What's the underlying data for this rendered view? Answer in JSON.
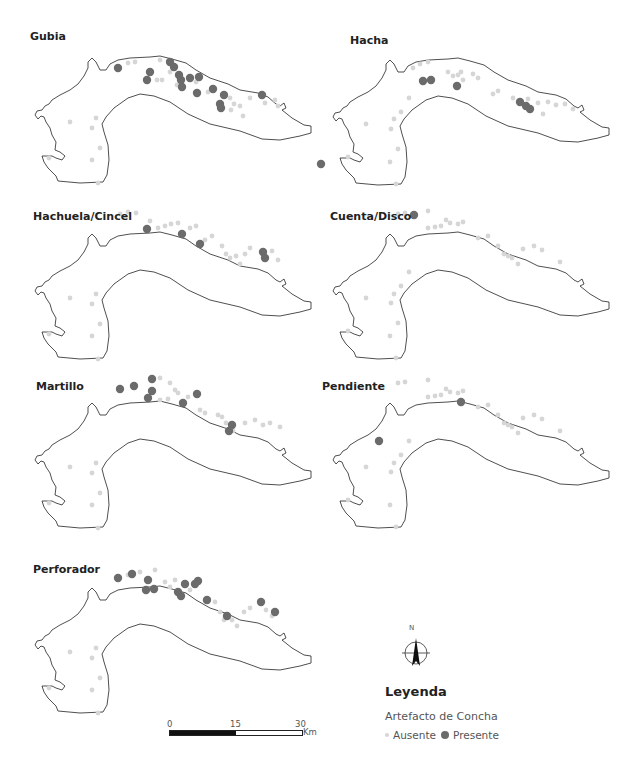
{
  "panels": [
    {
      "id": "gubia",
      "title": "Gubia",
      "title_pos": [
        30,
        30
      ],
      "offset": [
        0,
        0
      ],
      "present": [
        [
          118,
          68
        ],
        [
          150,
          72
        ],
        [
          147,
          80
        ],
        [
          170,
          62
        ],
        [
          174,
          67
        ],
        [
          179,
          75
        ],
        [
          181,
          80
        ],
        [
          190,
          78
        ],
        [
          199,
          77
        ],
        [
          182,
          87
        ],
        [
          197,
          93
        ],
        [
          213,
          89
        ],
        [
          224,
          95
        ],
        [
          220,
          104
        ],
        [
          221,
          108
        ],
        [
          262,
          95
        ]
      ],
      "absent": [
        [
          128,
          63
        ],
        [
          135,
          62
        ],
        [
          160,
          60
        ],
        [
          170,
          72
        ],
        [
          177,
          85
        ],
        [
          157,
          80
        ],
        [
          162,
          80
        ],
        [
          196,
          82
        ],
        [
          208,
          92
        ],
        [
          230,
          98
        ],
        [
          231,
          110
        ],
        [
          234,
          104
        ],
        [
          240,
          106
        ],
        [
          243,
          116
        ],
        [
          250,
          98
        ],
        [
          265,
          103
        ],
        [
          275,
          100
        ],
        [
          278,
          106
        ],
        [
          96,
          118
        ],
        [
          92,
          128
        ],
        [
          100,
          148
        ],
        [
          92,
          160
        ],
        [
          98,
          183
        ],
        [
          70,
          122
        ],
        [
          49,
          158
        ]
      ]
    },
    {
      "id": "hacha",
      "title": "Hacha",
      "title_pos": [
        350,
        34
      ],
      "offset": [
        298,
        2
      ],
      "present": [
        [
          125,
          79
        ],
        [
          133,
          78
        ],
        [
          159,
          84
        ],
        [
          222,
          100
        ],
        [
          228,
          104
        ],
        [
          232,
          107
        ],
        [
          23,
          162
        ]
      ],
      "absent": [
        [
          115,
          66
        ],
        [
          122,
          62
        ],
        [
          130,
          60
        ],
        [
          150,
          70
        ],
        [
          155,
          74
        ],
        [
          160,
          73
        ],
        [
          163,
          70
        ],
        [
          165,
          78
        ],
        [
          175,
          72
        ],
        [
          180,
          76
        ],
        [
          195,
          92
        ],
        [
          200,
          89
        ],
        [
          215,
          96
        ],
        [
          230,
          97
        ],
        [
          240,
          101
        ],
        [
          245,
          112
        ],
        [
          250,
          100
        ],
        [
          258,
          103
        ],
        [
          267,
          102
        ],
        [
          275,
          107
        ],
        [
          96,
          117
        ],
        [
          93,
          127
        ],
        [
          103,
          110
        ],
        [
          111,
          96
        ],
        [
          100,
          147
        ],
        [
          92,
          160
        ],
        [
          98,
          182
        ],
        [
          68,
          122
        ],
        [
          50,
          155
        ]
      ]
    },
    {
      "id": "hachuela",
      "title": "Hachuela/Cincel",
      "title_pos": [
        33,
        210
      ],
      "offset": [
        0,
        176
      ],
      "present": [
        [
          147,
          53
        ],
        [
          182,
          58
        ],
        [
          200,
          68
        ],
        [
          263,
          76
        ],
        [
          265,
          82
        ]
      ],
      "absent": [
        [
          120,
          38
        ],
        [
          128,
          36
        ],
        [
          136,
          37
        ],
        [
          150,
          45
        ],
        [
          158,
          52
        ],
        [
          165,
          50
        ],
        [
          171,
          48
        ],
        [
          178,
          47
        ],
        [
          190,
          52
        ],
        [
          196,
          50
        ],
        [
          205,
          64
        ],
        [
          212,
          60
        ],
        [
          222,
          70
        ],
        [
          226,
          78
        ],
        [
          230,
          82
        ],
        [
          236,
          80
        ],
        [
          240,
          88
        ],
        [
          245,
          78
        ],
        [
          250,
          72
        ],
        [
          272,
          75
        ],
        [
          278,
          84
        ],
        [
          96,
          118
        ],
        [
          92,
          128
        ],
        [
          100,
          148
        ],
        [
          92,
          160
        ],
        [
          98,
          183
        ],
        [
          70,
          122
        ],
        [
          49,
          158
        ]
      ]
    },
    {
      "id": "cuenta",
      "title": "Cuenta/Disco",
      "title_pos": [
        330,
        210
      ],
      "offset": [
        298,
        176
      ],
      "present": [
        [
          116,
          39
        ]
      ],
      "absent": [
        [
          100,
          38
        ],
        [
          107,
          37
        ],
        [
          130,
          35
        ],
        [
          148,
          44
        ],
        [
          152,
          47
        ],
        [
          160,
          48
        ],
        [
          165,
          46
        ],
        [
          130,
          52
        ],
        [
          137,
          51
        ],
        [
          143,
          50
        ],
        [
          180,
          62
        ],
        [
          190,
          60
        ],
        [
          200,
          70
        ],
        [
          206,
          78
        ],
        [
          210,
          80
        ],
        [
          214,
          82
        ],
        [
          220,
          88
        ],
        [
          225,
          73
        ],
        [
          236,
          70
        ],
        [
          244,
          74
        ],
        [
          262,
          86
        ],
        [
          96,
          118
        ],
        [
          93,
          127
        ],
        [
          103,
          110
        ],
        [
          111,
          96
        ],
        [
          100,
          147
        ],
        [
          92,
          160
        ],
        [
          98,
          182
        ],
        [
          68,
          122
        ],
        [
          50,
          155
        ]
      ]
    },
    {
      "id": "martillo",
      "title": "Martillo",
      "title_pos": [
        36,
        380
      ],
      "offset": [
        0,
        345
      ],
      "present": [
        [
          120,
          44
        ],
        [
          134,
          41
        ],
        [
          152,
          34
        ],
        [
          152,
          46
        ],
        [
          148,
          53
        ],
        [
          183,
          58
        ],
        [
          197,
          49
        ],
        [
          232,
          80
        ],
        [
          229,
          86
        ]
      ],
      "absent": [
        [
          160,
          33
        ],
        [
          170,
          38
        ],
        [
          175,
          45
        ],
        [
          160,
          55
        ],
        [
          168,
          54
        ],
        [
          178,
          48
        ],
        [
          188,
          52
        ],
        [
          200,
          65
        ],
        [
          205,
          68
        ],
        [
          218,
          70
        ],
        [
          222,
          72
        ],
        [
          226,
          78
        ],
        [
          233,
          86
        ],
        [
          245,
          78
        ],
        [
          255,
          75
        ],
        [
          263,
          80
        ],
        [
          270,
          78
        ],
        [
          280,
          82
        ],
        [
          96,
          118
        ],
        [
          92,
          128
        ],
        [
          100,
          148
        ],
        [
          92,
          160
        ],
        [
          98,
          183
        ],
        [
          70,
          122
        ],
        [
          49,
          158
        ]
      ]
    },
    {
      "id": "pendiente",
      "title": "Pendiente",
      "title_pos": [
        322,
        380
      ],
      "offset": [
        298,
        345
      ],
      "present": [
        [
          163,
          57
        ],
        [
          81,
          96
        ]
      ],
      "absent": [
        [
          100,
          38
        ],
        [
          107,
          37
        ],
        [
          130,
          35
        ],
        [
          148,
          44
        ],
        [
          152,
          47
        ],
        [
          160,
          48
        ],
        [
          165,
          46
        ],
        [
          130,
          52
        ],
        [
          137,
          51
        ],
        [
          143,
          50
        ],
        [
          180,
          62
        ],
        [
          190,
          60
        ],
        [
          200,
          70
        ],
        [
          206,
          78
        ],
        [
          210,
          80
        ],
        [
          214,
          82
        ],
        [
          220,
          88
        ],
        [
          225,
          73
        ],
        [
          236,
          70
        ],
        [
          244,
          74
        ],
        [
          262,
          86
        ],
        [
          96,
          118
        ],
        [
          93,
          127
        ],
        [
          103,
          110
        ],
        [
          111,
          96
        ],
        [
          92,
          160
        ],
        [
          98,
          182
        ],
        [
          68,
          122
        ],
        [
          50,
          155
        ]
      ]
    },
    {
      "id": "perforador",
      "title": "Perforador",
      "title_pos": [
        33,
        563
      ],
      "offset": [
        0,
        530
      ],
      "present": [
        [
          118,
          48
        ],
        [
          132,
          44
        ],
        [
          148,
          50
        ],
        [
          146,
          60
        ],
        [
          154,
          59
        ],
        [
          178,
          62
        ],
        [
          181,
          66
        ],
        [
          185,
          54
        ],
        [
          195,
          54
        ],
        [
          198,
          51
        ],
        [
          207,
          70
        ],
        [
          227,
          86
        ],
        [
          261,
          72
        ],
        [
          275,
          82
        ]
      ],
      "absent": [
        [
          128,
          45
        ],
        [
          140,
          42
        ],
        [
          155,
          40
        ],
        [
          165,
          52
        ],
        [
          170,
          57
        ],
        [
          175,
          50
        ],
        [
          190,
          60
        ],
        [
          205,
          71
        ],
        [
          215,
          72
        ],
        [
          220,
          82
        ],
        [
          224,
          90
        ],
        [
          232,
          90
        ],
        [
          237,
          96
        ],
        [
          244,
          82
        ],
        [
          250,
          78
        ],
        [
          266,
          80
        ],
        [
          272,
          86
        ],
        [
          96,
          118
        ],
        [
          92,
          128
        ],
        [
          100,
          148
        ],
        [
          92,
          160
        ],
        [
          98,
          183
        ],
        [
          70,
          122
        ],
        [
          49,
          158
        ]
      ]
    }
  ],
  "colors": {
    "present": "#6b6b6b",
    "absent": "#d6d6d6",
    "outline": "#222222"
  },
  "north_arrow": {
    "label": "N"
  },
  "legend": {
    "title": "Leyenda",
    "subtitle": "Artefacto de Concha",
    "items": [
      {
        "label": "Ausente",
        "type": "absent"
      },
      {
        "label": "Presente",
        "type": "present"
      }
    ]
  },
  "scale_bar": {
    "ticks": [
      "0",
      "15",
      "30"
    ],
    "unit": "Km"
  }
}
